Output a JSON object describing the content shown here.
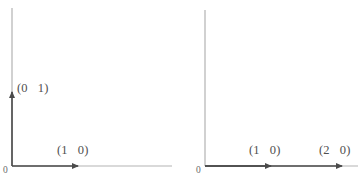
{
  "figure": {
    "background_color": "#ffffff",
    "axis_color": "#b3b3b3",
    "vector_color": "#4a4a4a",
    "label_color": "#4f4f4f",
    "origin_label_color": "#6a6a6a"
  },
  "panels": [
    {
      "id": "left-panel",
      "origin_label": "0",
      "axes": {
        "vertical": {
          "x": 12,
          "y_top": 8,
          "y_bottom": 166
        },
        "horizontal": {
          "y": 166,
          "x_left": 12,
          "x_right": 172
        }
      },
      "vectors": [
        {
          "name": "unit-vector-e2",
          "label": "(0   1)",
          "direction": "up",
          "from": [
            12,
            166
          ],
          "to": [
            12,
            88
          ],
          "label_x": 16,
          "label_y": 84
        },
        {
          "name": "unit-vector-e1",
          "label": "(1   0)",
          "direction": "right",
          "from": [
            12,
            166
          ],
          "to": [
            83,
            166
          ],
          "label_x": 56,
          "label_y": 146
        }
      ]
    },
    {
      "id": "right-panel",
      "origin_label": "0",
      "axes": {
        "vertical": {
          "x": 23,
          "y_top": 10,
          "y_bottom": 166
        },
        "horizontal": {
          "y": 166,
          "x_left": 23,
          "x_right": 176
        }
      },
      "vectors": [
        {
          "name": "vector-1-0",
          "label": "(1   0)",
          "direction": "right",
          "from": [
            23,
            166
          ],
          "to": [
            94,
            166
          ],
          "label_x": 66,
          "label_y": 146
        },
        {
          "name": "vector-2-0",
          "label": "(2   0)",
          "direction": "right",
          "from": [
            23,
            166
          ],
          "to": [
            165,
            166
          ],
          "label_x": 136,
          "label_y": 146
        }
      ]
    }
  ],
  "caption": {
    "text": ""
  }
}
